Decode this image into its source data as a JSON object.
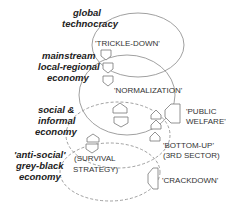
{
  "diagram": {
    "levels": [
      {
        "id": "global",
        "label_lines": [
          "global",
          "technocracy"
        ],
        "inner_text": "'TRICKLE-DOWN'",
        "boundary": "solid"
      },
      {
        "id": "mainstream",
        "label_lines": [
          "mainstream",
          "local-regional",
          "economy"
        ],
        "inner_text": "'NORMALIZATION'",
        "boundary": "solid"
      },
      {
        "id": "social",
        "label_lines": [
          "social &",
          "informal",
          "economy"
        ],
        "inner_text": "",
        "boundary": "dashed"
      },
      {
        "id": "antisocial",
        "label_lines": [
          "'anti-social'",
          "grey-black",
          "economy"
        ],
        "inner_text_lines": [
          "(SURVIVAL",
          "STRATEGY)"
        ],
        "boundary": "dashed"
      }
    ],
    "side_labels": [
      {
        "id": "public-welfare",
        "lines": [
          "'PUBLIC",
          "WELFARE'"
        ]
      },
      {
        "id": "bottom-up",
        "lines": [
          "'BOTTOM-UP'",
          "(3RD SECTOR)"
        ]
      },
      {
        "id": "crackdown",
        "lines": [
          "'CRACKDOWN'"
        ]
      }
    ],
    "arrows": {
      "down": 4,
      "up": 5,
      "left": 2
    }
  }
}
